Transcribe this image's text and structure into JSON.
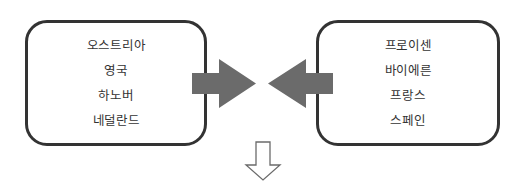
{
  "diagram": {
    "left_group": {
      "items": [
        "오스트리아",
        "영국",
        "하노버",
        "네덜란드"
      ]
    },
    "right_group": {
      "items": [
        "프로이센",
        "바이에른",
        "프랑스",
        "스페인"
      ]
    },
    "arrows": {
      "left_to_center": {
        "direction": "right",
        "color": "#6b6b6b"
      },
      "right_to_center": {
        "direction": "left",
        "color": "#6b6b6b"
      },
      "down_outline": {
        "direction": "down",
        "stroke": "#6b6b6b"
      }
    }
  }
}
